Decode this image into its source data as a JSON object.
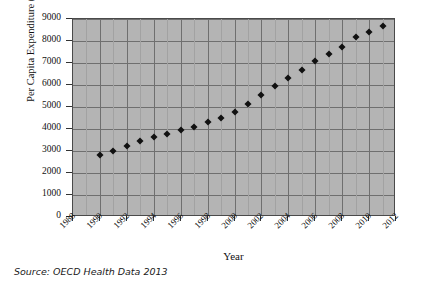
{
  "chart_data": {
    "type": "scatter",
    "title": "",
    "xlabel": "Year",
    "ylabel": "Per Capita Expenditure ($)",
    "xlim": [
      1988,
      2012
    ],
    "ylim": [
      0,
      9000
    ],
    "xticks": [
      1988,
      1990,
      1992,
      1994,
      1996,
      1998,
      2000,
      2002,
      2004,
      2006,
      2008,
      2010,
      2012
    ],
    "yticks": [
      0,
      1000,
      2000,
      3000,
      4000,
      5000,
      6000,
      7000,
      8000,
      9000
    ],
    "grid": true,
    "legend": "none",
    "marker": "diamond",
    "marker_color": "#111111",
    "plot_background": "#b4b4b4",
    "x": [
      1990,
      1991,
      1992,
      1993,
      1994,
      1995,
      1996,
      1997,
      1998,
      1999,
      2000,
      2001,
      2002,
      2003,
      2004,
      2005,
      2006,
      2007,
      2008,
      2009,
      2010,
      2011
    ],
    "values": [
      2800,
      3020,
      3250,
      3440,
      3620,
      3790,
      3960,
      4110,
      4300,
      4520,
      4790,
      5130,
      5550,
      5960,
      6310,
      6670,
      7070,
      7420,
      7710,
      8180,
      8430,
      8700
    ],
    "series": [
      {
        "name": "Per Capita Expenditure ($)",
        "values": [
          2800,
          3020,
          3250,
          3440,
          3620,
          3790,
          3960,
          4110,
          4300,
          4520,
          4790,
          5130,
          5550,
          5960,
          6310,
          6670,
          7070,
          7420,
          7710,
          8180,
          8430,
          8700
        ]
      }
    ]
  },
  "caption": {
    "source": "Source: OECD Health Data 2013"
  }
}
